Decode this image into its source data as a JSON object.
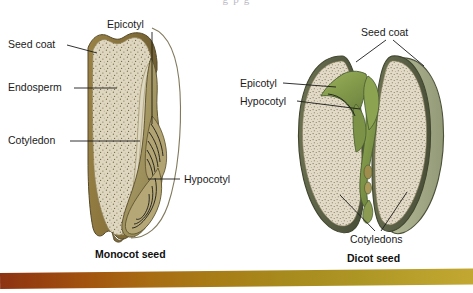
{
  "page": {
    "background_color": "#ffffff",
    "width": 473,
    "height": 293
  },
  "cut_text": {
    "top_partial": "g          p            g"
  },
  "figure": {
    "type": "biology-diagram",
    "panels": [
      {
        "id": "monocot",
        "caption": "Monocot seed",
        "seed_coat_color": "#8a7337",
        "endosperm_color": "#ded7c0",
        "cotyledon_color": "#d9d2bb",
        "embryo_color": "#a79a68",
        "labels": [
          {
            "name": "seed-coat",
            "text": "Seed coat",
            "x": 8,
            "y": 48
          },
          {
            "name": "endosperm",
            "text": "Endosperm",
            "x": 8,
            "y": 87
          },
          {
            "name": "cotyledon",
            "text": "Cotyledon",
            "x": 8,
            "y": 140
          },
          {
            "name": "epicotyl",
            "text": "Epicotyl",
            "x": 107,
            "y": 25
          },
          {
            "name": "hypocotyl",
            "text": "Hypocotyl",
            "x": 184,
            "y": 182
          }
        ]
      },
      {
        "id": "dicot",
        "caption": "Dicot seed",
        "seed_coat_color": "#5d6346",
        "cotyledon_color": "#ded5c1",
        "embryo_color": "#7e9a4a",
        "labels": [
          {
            "name": "seed-coat",
            "text": "Seed coat",
            "x": 361,
            "y": 33
          },
          {
            "name": "epicotyl",
            "text": "Epicotyl",
            "x": 240,
            "y": 83
          },
          {
            "name": "hypocotyl",
            "text": "Hypocotyl",
            "x": 240,
            "y": 103
          },
          {
            "name": "cotyledons",
            "text": "Cotyledons",
            "x": 362,
            "y": 236
          }
        ]
      }
    ]
  },
  "footer": {
    "bar_color_start": "#8d3312",
    "bar_color_end": "#c2a832"
  }
}
